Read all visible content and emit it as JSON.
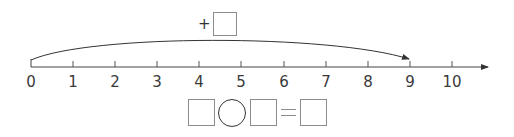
{
  "number_line": {
    "min": 0,
    "max": 10,
    "tick_labels": [
      "0",
      "1",
      "2",
      "3",
      "4",
      "5",
      "6",
      "7",
      "8",
      "9",
      "10"
    ],
    "tick_x": [
      31,
      73,
      115,
      157,
      199,
      241,
      284,
      326,
      368,
      410,
      452
    ],
    "axis_y": 67,
    "axis_end_x": 488,
    "has_arrow": true
  },
  "jump_arc": {
    "from": 0,
    "to": 9,
    "operator_label": "+",
    "answer_box_value": ""
  },
  "equation": {
    "left_operand": "",
    "operator": "",
    "right_operand": "",
    "equals_sign": "=",
    "result": ""
  },
  "colors": {
    "line": "#333333",
    "box_border": "#8c8c8c",
    "text": "#3a3a3a"
  }
}
